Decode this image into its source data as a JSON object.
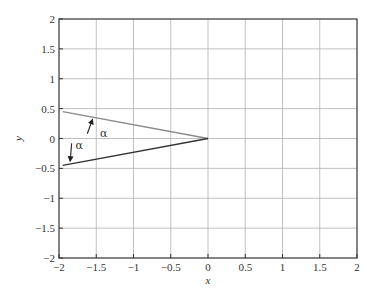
{
  "chart_data": {
    "type": "line",
    "title": "",
    "xlabel": "x",
    "ylabel": "y",
    "xlim": [
      -2,
      2
    ],
    "ylim": [
      -2,
      2
    ],
    "grid": true,
    "legend": null,
    "xticks": [
      -2,
      -1.5,
      -1,
      -0.5,
      0,
      0.5,
      1,
      1.5,
      2
    ],
    "yticks": [
      -2,
      -1.5,
      -1,
      -0.5,
      0,
      0.5,
      1,
      1.5,
      2
    ],
    "xtick_labels": [
      "−2",
      "−1.5",
      "−1",
      "−0.5",
      "0",
      "0.5",
      "1",
      "1.5",
      "2"
    ],
    "ytick_labels": [
      "−2",
      "−1.5",
      "−1",
      "−0.5",
      "0",
      "0.5",
      "1",
      "1.5",
      "2"
    ],
    "series": [
      {
        "name": "upper-ray",
        "color": "#8a8a8a",
        "x": [
          -1.95,
          0
        ],
        "y": [
          0.45,
          0
        ]
      },
      {
        "name": "lower-ray",
        "color": "#333333",
        "x": [
          -1.95,
          0
        ],
        "y": [
          -0.45,
          0
        ]
      }
    ],
    "annotations": [
      {
        "text": "α",
        "x": -1.45,
        "y": 0.03,
        "arrow_from": [
          -1.62,
          0.08
        ],
        "arrow_to": [
          -1.55,
          0.32
        ],
        "direction": "up"
      },
      {
        "text": "α",
        "x": -1.78,
        "y": -0.17,
        "arrow_from": [
          -1.83,
          -0.08
        ],
        "arrow_to": [
          -1.85,
          -0.38
        ],
        "direction": "down"
      }
    ]
  },
  "colors": {
    "axes": "#333333",
    "grid": "#b0b0b0",
    "upper_ray": "#8a8a8a",
    "lower_ray": "#333333"
  }
}
